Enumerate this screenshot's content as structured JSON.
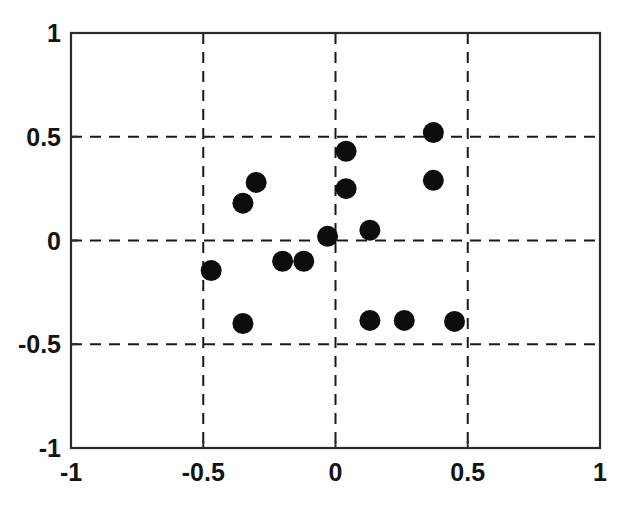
{
  "figure": {
    "background_color": "#ffffff",
    "axes_color": "#2b2b2b",
    "grid_color": "#1a1a1a",
    "marker_color": "#0d0d0d"
  },
  "chart_data": {
    "type": "scatter",
    "title": "",
    "xlabel": "",
    "ylabel": "",
    "xlim": [
      -1,
      1
    ],
    "ylim": [
      -1,
      1
    ],
    "grid": true,
    "grid_style": "dashed",
    "legend": null,
    "marker": {
      "shape": "circle",
      "color": "#0d0d0d",
      "size_px": 20
    },
    "xticks": [
      -1,
      -0.5,
      0,
      0.5,
      1
    ],
    "yticks": [
      -1,
      -0.5,
      0,
      0.5,
      1
    ],
    "xtick_labels": [
      "-1",
      "-0.5",
      "0",
      "0.5",
      "1"
    ],
    "ytick_labels": [
      "-1",
      "-0.5",
      "0",
      "0.5",
      "1"
    ],
    "n_points": 15,
    "points": [
      {
        "x": 0.37,
        "y": 0.52
      },
      {
        "x": 0.04,
        "y": 0.43
      },
      {
        "x": 0.37,
        "y": 0.29
      },
      {
        "x": -0.3,
        "y": 0.28
      },
      {
        "x": 0.04,
        "y": 0.25
      },
      {
        "x": -0.35,
        "y": 0.18
      },
      {
        "x": 0.13,
        "y": 0.05
      },
      {
        "x": -0.03,
        "y": 0.02
      },
      {
        "x": -0.47,
        "y": -0.145
      },
      {
        "x": -0.2,
        "y": -0.1
      },
      {
        "x": -0.12,
        "y": -0.1
      },
      {
        "x": -0.35,
        "y": -0.4
      },
      {
        "x": 0.13,
        "y": -0.385
      },
      {
        "x": 0.26,
        "y": -0.385
      },
      {
        "x": 0.45,
        "y": -0.39
      }
    ],
    "series": [
      {
        "name": "points",
        "x": [
          0.37,
          0.04,
          0.37,
          -0.3,
          0.04,
          -0.35,
          0.13,
          -0.03,
          -0.47,
          -0.2,
          -0.12,
          -0.35,
          0.13,
          0.26,
          0.45
        ],
        "y": [
          0.52,
          0.43,
          0.29,
          0.28,
          0.25,
          0.18,
          0.05,
          0.02,
          -0.145,
          -0.1,
          -0.1,
          -0.4,
          -0.385,
          -0.385,
          -0.39
        ]
      }
    ]
  }
}
